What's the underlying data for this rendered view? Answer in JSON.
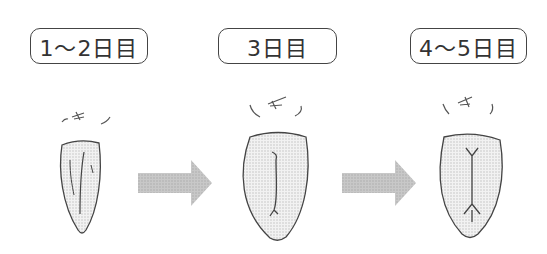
{
  "stages": [
    {
      "label": "1～2日目"
    },
    {
      "label": "3日目"
    },
    {
      "label": "4～5日目"
    }
  ],
  "colors": {
    "outline": "#444444",
    "arrow": "#bdbdbd",
    "fill": "#e6e6e6"
  }
}
